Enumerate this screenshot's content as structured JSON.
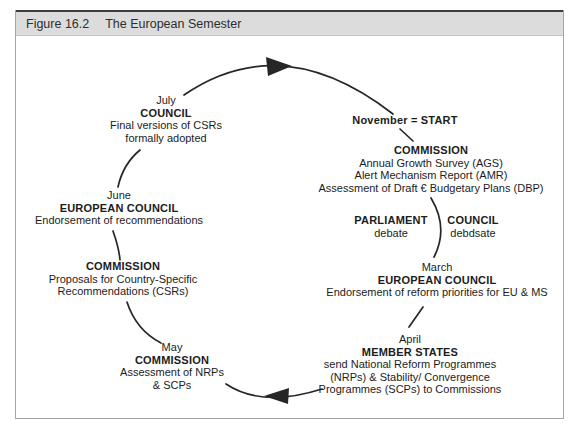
{
  "figure": {
    "label": "Figure 16.2",
    "title": "The European Semester"
  },
  "diagram": {
    "type": "circular-flow",
    "flow_direction": "clockwise",
    "nodes": {
      "july": {
        "month": "July",
        "actor": "COUNCIL",
        "lines": [
          "Final versions of CSRs",
          "formally adopted"
        ]
      },
      "november": {
        "label": "November = START"
      },
      "commission_autumn": {
        "actor": "COMMISSION",
        "lines": [
          "Annual Growth Survey (AGS)",
          "Alert Mechanism Report (AMR)",
          "Assessment of Draft € Budgetary Plans (DBP)"
        ]
      },
      "parliament": {
        "actor": "PARLIAMENT",
        "lines": [
          "debate"
        ]
      },
      "council_debate": {
        "actor": "COUNCIL",
        "lines": [
          "debdsate"
        ]
      },
      "march": {
        "month": "March",
        "actor": "EUROPEAN COUNCIL",
        "lines": [
          "Endorsement of reform priorities for EU & MS"
        ]
      },
      "april": {
        "month": "April",
        "actor": "MEMBER STATES",
        "lines": [
          "send National Reform Programmes",
          "(NRPs) & Stability/ Convergence",
          "Programmes (SCPs) to Commissions"
        ]
      },
      "may": {
        "month": "May",
        "actor": "COMMISSION",
        "lines": [
          "Assessment of NRPs",
          "& SCPs"
        ]
      },
      "commission_csr": {
        "actor": "COMMISSION",
        "lines": [
          "Proposals for Country-Specific",
          "Recommendations (CSRs)"
        ]
      },
      "june": {
        "month": "June",
        "actor": "EUROPEAN COUNCIL",
        "lines": [
          "Endorsement of recommendations"
        ]
      }
    },
    "colors": {
      "text": "#1c1c1c",
      "line": "#262626",
      "titlebar_bg": "#dcdcdc",
      "titlebar_top_rule": "#3c3c3c",
      "box_border": "#a6a6a6"
    }
  }
}
